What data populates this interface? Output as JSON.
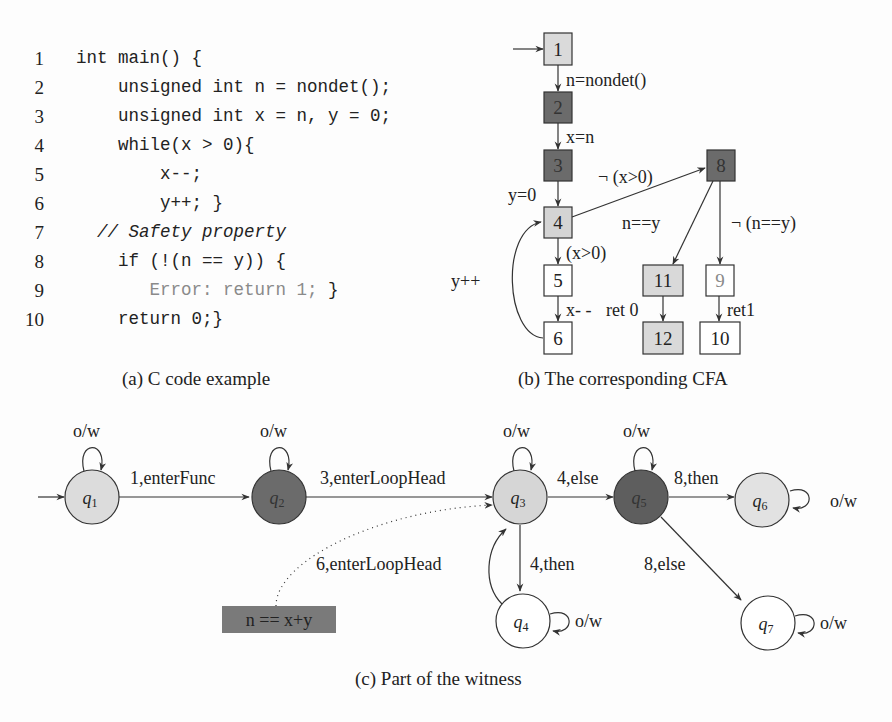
{
  "colors": {
    "light_fill": "#d9d9d9",
    "dark_fill": "#6b6b6b",
    "white_fill": "#ffffff",
    "stroke": "#333333",
    "error_text": "#8a8a8a"
  },
  "code_panel": {
    "caption": "(a) C code example",
    "lines": [
      {
        "num": "1",
        "text": "int main() {"
      },
      {
        "num": "2",
        "text": "    unsigned int n = nondet();"
      },
      {
        "num": "3",
        "text": "    unsigned int x = n, y = 0;"
      },
      {
        "num": "4",
        "text": "    while(x > 0){"
      },
      {
        "num": "5",
        "text": "        x--;"
      },
      {
        "num": "6",
        "text": "        y++; }"
      },
      {
        "num": "7",
        "text": "  // Safety property"
      },
      {
        "num": "8",
        "text": "    if (!(n == y)) {"
      },
      {
        "num": "9",
        "text": "       Error: return 1; }",
        "error_part": "Error: return 1;",
        "tail": " }"
      },
      {
        "num": "10",
        "text": "    return 0;}"
      }
    ]
  },
  "cfa_panel": {
    "caption": "(b) The corresponding CFA",
    "nodes": [
      {
        "id": "1",
        "fill": "light"
      },
      {
        "id": "2",
        "fill": "dark"
      },
      {
        "id": "3",
        "fill": "dark"
      },
      {
        "id": "4",
        "fill": "light"
      },
      {
        "id": "5",
        "fill": "white"
      },
      {
        "id": "6",
        "fill": "white"
      },
      {
        "id": "8",
        "fill": "dark"
      },
      {
        "id": "11",
        "fill": "light"
      },
      {
        "id": "9",
        "fill": "white"
      },
      {
        "id": "12",
        "fill": "light"
      },
      {
        "id": "10",
        "fill": "white"
      }
    ],
    "edges": [
      {
        "from": "1",
        "to": "2",
        "label": "n=nondet()"
      },
      {
        "from": "2",
        "to": "3",
        "label": "x=n"
      },
      {
        "from": "3",
        "to": "4",
        "label": "y=0"
      },
      {
        "from": "4",
        "to": "8",
        "label": "¬ (x>0)"
      },
      {
        "from": "4",
        "to": "5",
        "label": "(x>0)"
      },
      {
        "from": "5",
        "to": "6",
        "label": "x- -"
      },
      {
        "from": "6",
        "to": "4",
        "label": "y++"
      },
      {
        "from": "8",
        "to": "11",
        "label": "n==y"
      },
      {
        "from": "8",
        "to": "9",
        "label": "¬ (n==y)"
      },
      {
        "from": "11",
        "to": "12",
        "label": "ret 0"
      },
      {
        "from": "9",
        "to": "10",
        "label": "ret1"
      }
    ]
  },
  "witness_panel": {
    "caption": "(c) Part of the witness",
    "states": [
      {
        "id": "q1",
        "sub": "1",
        "fill": "light"
      },
      {
        "id": "q2",
        "sub": "2",
        "fill": "dark"
      },
      {
        "id": "q3",
        "sub": "3",
        "fill": "light"
      },
      {
        "id": "q4",
        "sub": "4",
        "fill": "white"
      },
      {
        "id": "q5",
        "sub": "5",
        "fill": "dark"
      },
      {
        "id": "q6",
        "sub": "6",
        "fill": "light"
      },
      {
        "id": "q7",
        "sub": "7",
        "fill": "white"
      }
    ],
    "self_loop_label": "o/w",
    "transitions": [
      {
        "from": "q1",
        "to": "q2",
        "label": "1,enterFunc"
      },
      {
        "from": "q2",
        "to": "q3",
        "label": "3,enterLoopHead"
      },
      {
        "from": "q3",
        "to": "q5",
        "label": "4,else"
      },
      {
        "from": "q3",
        "to": "q4",
        "label": "4,then"
      },
      {
        "from": "q4",
        "to": "q3",
        "label": "6,enterLoopHead"
      },
      {
        "from": "q5",
        "to": "q6",
        "label": "8,then"
      },
      {
        "from": "q5",
        "to": "q7",
        "label": "8,else"
      }
    ],
    "invariant": "n == x+y"
  }
}
